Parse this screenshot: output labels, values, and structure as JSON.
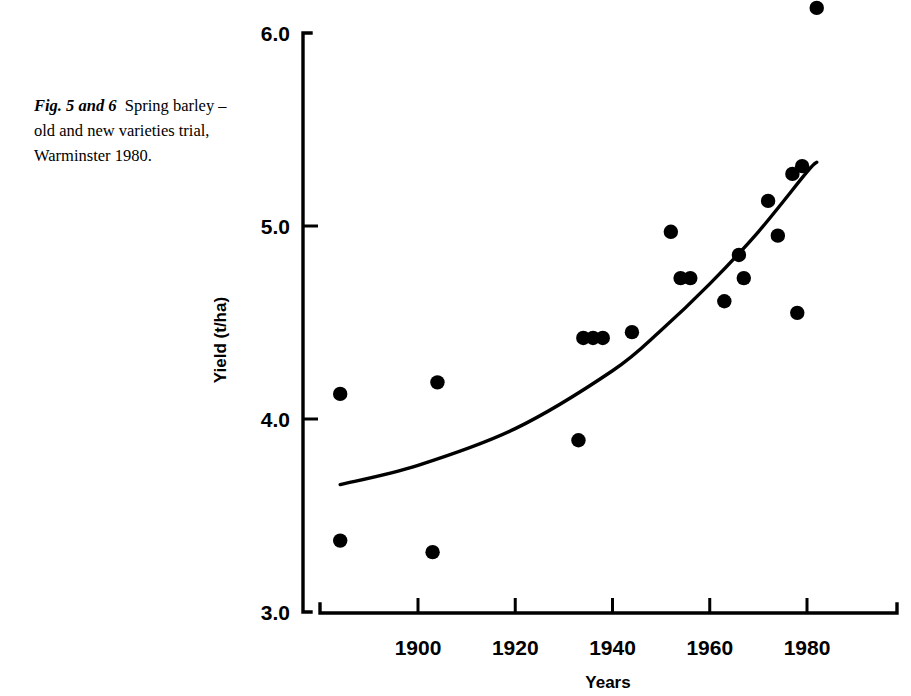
{
  "caption": {
    "figure_label": "Fig. 5 and 6",
    "text": "Spring barley – old and new varieties trial, Warminster 1980."
  },
  "chart_data": {
    "type": "scatter",
    "title": "",
    "xlabel": "Years",
    "ylabel": "Yield (t/ha)",
    "xlim": [
      1880,
      1984
    ],
    "ylim": [
      3.0,
      6.0
    ],
    "xticks": [
      1900,
      1920,
      1940,
      1960,
      1980
    ],
    "xtick_labels": [
      "1900",
      "1920",
      "1940",
      "1960",
      "1980"
    ],
    "yticks": [
      3.0,
      4.0,
      5.0,
      6.0
    ],
    "ytick_labels": [
      "3.0",
      "4.0",
      "5.0",
      "6.0"
    ],
    "grid": false,
    "legend": null,
    "points": [
      {
        "x": 1884,
        "y": 4.13
      },
      {
        "x": 1884,
        "y": 3.37
      },
      {
        "x": 1904,
        "y": 4.19
      },
      {
        "x": 1903,
        "y": 3.31
      },
      {
        "x": 1933,
        "y": 3.89
      },
      {
        "x": 1934,
        "y": 4.42
      },
      {
        "x": 1936,
        "y": 4.42
      },
      {
        "x": 1938,
        "y": 4.42
      },
      {
        "x": 1944,
        "y": 4.45
      },
      {
        "x": 1952,
        "y": 4.97
      },
      {
        "x": 1954,
        "y": 4.73
      },
      {
        "x": 1956,
        "y": 4.73
      },
      {
        "x": 1963,
        "y": 4.61
      },
      {
        "x": 1966,
        "y": 4.85
      },
      {
        "x": 1967,
        "y": 4.73
      },
      {
        "x": 1972,
        "y": 5.13
      },
      {
        "x": 1974,
        "y": 4.95
      },
      {
        "x": 1977,
        "y": 5.27
      },
      {
        "x": 1979,
        "y": 5.31
      },
      {
        "x": 1978,
        "y": 4.55
      },
      {
        "x": 1982,
        "y": 6.13
      }
    ],
    "fit_curve": {
      "description": "fitted trend curve",
      "points": [
        {
          "x": 1884,
          "y": 3.66
        },
        {
          "x": 1900,
          "y": 3.76
        },
        {
          "x": 1920,
          "y": 3.95
        },
        {
          "x": 1940,
          "y": 4.25
        },
        {
          "x": 1950,
          "y": 4.46
        },
        {
          "x": 1960,
          "y": 4.7
        },
        {
          "x": 1970,
          "y": 4.97
        },
        {
          "x": 1980,
          "y": 5.28
        },
        {
          "x": 1982,
          "y": 5.33
        }
      ]
    }
  }
}
